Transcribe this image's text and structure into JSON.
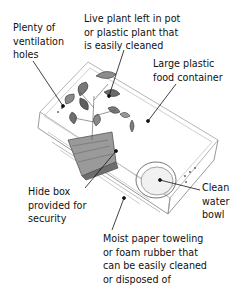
{
  "diagram": {
    "labels": {
      "ventilation": [
        "Plenty of",
        "ventilation",
        "holes"
      ],
      "plant": [
        "Live plant left in pot",
        "or plastic plant that",
        "is easily cleaned"
      ],
      "container": [
        "Large plastic",
        "food container"
      ],
      "hide_box": [
        "Hide box",
        "provided for",
        "security"
      ],
      "water_bowl": [
        "Clean",
        "water",
        "bowl"
      ],
      "substrate": [
        "Moist paper toweling",
        "or foam rubber that",
        "can be easily cleaned",
        "or disposed of"
      ]
    },
    "colors": {
      "ink": "#111111",
      "sketch": "#8a8a8a",
      "leaf": "#6e6e6e",
      "background": "#ffffff"
    }
  }
}
